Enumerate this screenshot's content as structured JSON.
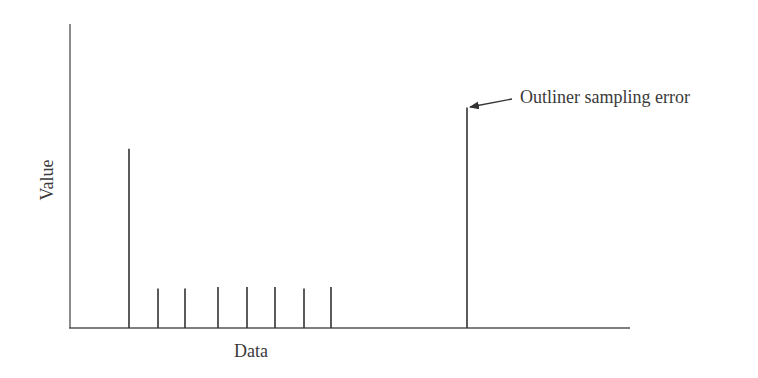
{
  "chart_data": {
    "type": "bar",
    "style": "stem/impulse lines",
    "title": "",
    "xlabel": "Data",
    "ylabel": "Value",
    "grid": false,
    "legend": null,
    "axis_ticks": "none",
    "x": [
      1,
      2,
      3,
      4,
      5,
      6,
      7,
      8,
      9
    ],
    "x_positions_px": [
      129,
      158,
      185,
      218,
      247,
      275,
      304,
      331,
      467
    ],
    "values": [
      59,
      13,
      13,
      13.5,
      13.5,
      13.5,
      13,
      13.5,
      72.5
    ],
    "value_scale_note": "relative heights; y-axis unlabeled, 0 at baseline, ~100 at top of y-axis",
    "ylim": [
      0,
      100
    ],
    "annotations": [
      {
        "text": "Outliner sampling error",
        "target_index": 8,
        "arrow": true
      }
    ]
  },
  "labels": {
    "xlabel": "Data",
    "ylabel": "Value",
    "annotation": "Outliner sampling error"
  },
  "colors": {
    "axis": "#555555",
    "stem": "#333333",
    "text": "#3a3a3a"
  }
}
